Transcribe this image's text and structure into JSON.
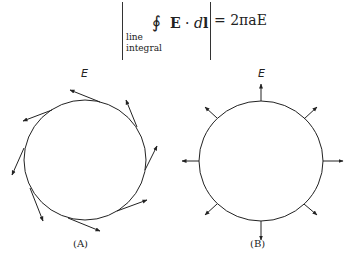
{
  "equation": {
    "integral_symbol": "∮",
    "field": "E",
    "dot": "·",
    "differential": "dl",
    "d": "d",
    "l": "l",
    "equals_rhs": "= 2πaE",
    "sub_line1": "line",
    "sub_line2": "integral"
  },
  "panel_a": {
    "field_label": "E",
    "caption": "(A)",
    "description": "tangential field vectors around circle"
  },
  "panel_b": {
    "field_label": "E",
    "caption": "(B)",
    "description": "radial field vectors around circle"
  },
  "colors": {
    "stroke": "#222222",
    "background": "#ffffff"
  }
}
